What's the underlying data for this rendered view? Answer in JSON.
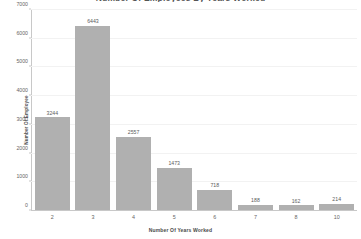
{
  "chart_data": {
    "type": "bar",
    "title": "Number Of Employees By Years Worked",
    "title_cropped": true,
    "xlabel": "Number Of Years Worked",
    "ylabel": "Number Of Employee",
    "categories": [
      "2",
      "3",
      "4",
      "5",
      "6",
      "7",
      "8",
      "10"
    ],
    "values": [
      3244,
      6443,
      2557,
      1473,
      718,
      188,
      162,
      214
    ],
    "value_labels": [
      "3244",
      "6443",
      "2557",
      "1473",
      "718",
      "188",
      "162",
      "214"
    ],
    "ylim": [
      0,
      7000
    ],
    "ytick_labels": [
      "0",
      "1000",
      "2000",
      "3000",
      "4000",
      "5000",
      "6000",
      "7000"
    ],
    "ytick_values": [
      0,
      1000,
      2000,
      3000,
      4000,
      5000,
      6000,
      7000
    ],
    "grid": true,
    "legend": "none",
    "bar_color": "#b0b0b0",
    "grid_color": "#f2f2f2",
    "axis_color": "#c8c8c8",
    "background": "#ffffff"
  }
}
